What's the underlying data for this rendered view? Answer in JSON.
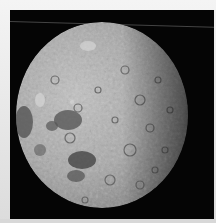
{
  "image": {
    "subject": "Moon",
    "description": "Photograph of the Moon (far side) against black space, terminator on the right edge",
    "colors": {
      "space": "#050505",
      "frame": "#e9e9e9",
      "highland": "#a9a9a9",
      "mare": "#4d4d4d"
    }
  }
}
